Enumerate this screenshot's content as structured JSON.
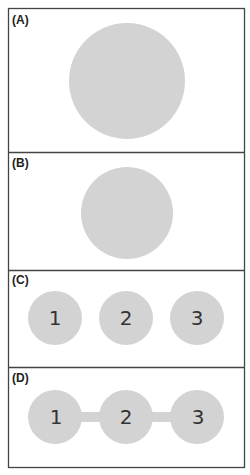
{
  "figure": {
    "colors": {
      "circle": "#d3d3d3",
      "border": "#444444",
      "background": "#ffffff",
      "text": "#222222"
    },
    "panels": [
      {
        "label": "(A)",
        "description": "single large circle"
      },
      {
        "label": "(B)",
        "description": "single medium circle"
      },
      {
        "label": "(C)",
        "description": "three separate circles",
        "nodes": [
          "1",
          "2",
          "3"
        ]
      },
      {
        "label": "(D)",
        "description": "three circles connected by bars",
        "nodes": [
          "1",
          "2",
          "3"
        ]
      }
    ]
  }
}
